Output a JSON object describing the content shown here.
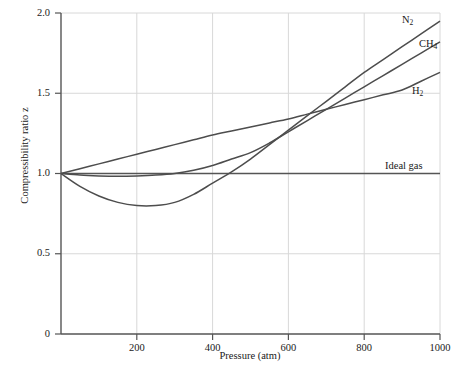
{
  "chart_data": {
    "type": "line",
    "title": "",
    "xlabel": "Pressure (atm)",
    "ylabel": "Compressibility ratio z",
    "xlim": [
      0,
      1000
    ],
    "ylim": [
      0,
      2.0
    ],
    "grid": true,
    "legend_position": "inline-right-end-of-curve",
    "xticks": [
      "200",
      "400",
      "600",
      "800",
      "1000"
    ],
    "xtick_values": [
      200,
      400,
      600,
      800,
      1000
    ],
    "yticks": [
      "0",
      "0.5",
      "1.0",
      "1.5",
      "2.0"
    ],
    "ytick_values": [
      0,
      0.5,
      1.0,
      1.5,
      2.0
    ],
    "x": [
      0,
      50,
      100,
      150,
      200,
      250,
      300,
      350,
      400,
      450,
      500,
      550,
      600,
      650,
      700,
      750,
      800,
      850,
      900,
      950,
      1000
    ],
    "series": [
      {
        "name": "N2",
        "label_html": "N<sub>2</sub>",
        "label_text": "N2",
        "color": "#4d4d4d",
        "values": [
          1.0,
          0.92,
          0.86,
          0.82,
          0.8,
          0.8,
          0.82,
          0.87,
          0.94,
          1.01,
          1.09,
          1.18,
          1.27,
          1.36,
          1.45,
          1.54,
          1.63,
          1.71,
          1.79,
          1.87,
          1.95
        ]
      },
      {
        "name": "CH4",
        "label_html": "CH<sub>4</sub>",
        "label_text": "CH4",
        "color": "#4d4d4d",
        "values": [
          1.0,
          0.99,
          0.985,
          0.983,
          0.985,
          0.99,
          1.0,
          1.02,
          1.05,
          1.09,
          1.13,
          1.19,
          1.26,
          1.33,
          1.4,
          1.47,
          1.54,
          1.61,
          1.68,
          1.75,
          1.82
        ]
      },
      {
        "name": "H2",
        "label_html": "H<sub>2</sub>",
        "label_text": "H2",
        "color": "#4d4d4d",
        "values": [
          1.0,
          1.03,
          1.06,
          1.09,
          1.12,
          1.15,
          1.18,
          1.21,
          1.24,
          1.265,
          1.29,
          1.315,
          1.34,
          1.37,
          1.4,
          1.43,
          1.46,
          1.49,
          1.52,
          1.575,
          1.63
        ]
      },
      {
        "name": "Ideal gas",
        "label_html": "Ideal gas",
        "label_text": "Ideal gas",
        "color": "#555555",
        "values": [
          1.0,
          1.0,
          1.0,
          1.0,
          1.0,
          1.0,
          1.0,
          1.0,
          1.0,
          1.0,
          1.0,
          1.0,
          1.0,
          1.0,
          1.0,
          1.0,
          1.0,
          1.0,
          1.0,
          1.0,
          1.0
        ]
      }
    ],
    "annotations": [
      {
        "text": "N2",
        "x": 930,
        "y": 1.93
      },
      {
        "text": "CH4",
        "x": 955,
        "y": 1.78
      },
      {
        "text": "H2",
        "x": 950,
        "y": 1.47
      },
      {
        "text": "Ideal gas",
        "x": 900,
        "y": 1.07
      }
    ]
  },
  "axes": {
    "ylabel": "Compressibility ratio z",
    "xlabel": "Pressure (atm)",
    "ytick_labels": [
      "2.0",
      "1.5",
      "1.0",
      "0.5",
      "0"
    ],
    "xtick_labels": [
      "200",
      "400",
      "600",
      "800",
      "1000"
    ]
  },
  "curve_labels": {
    "n2": "N2",
    "ch4": "CH4",
    "h2": "H2",
    "ideal": "Ideal gas"
  },
  "colors": {
    "curve": "#4d4d4d",
    "grid": "#d8d8d8",
    "axis": "#555555",
    "text": "#1a1a1a"
  }
}
